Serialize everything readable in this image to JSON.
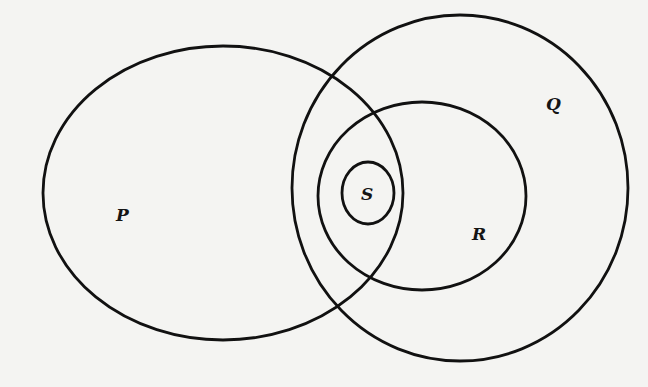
{
  "diagram": {
    "type": "venn",
    "colors": {
      "background": "#f4f4f2",
      "stroke": "#111111",
      "label": "#151515"
    },
    "sets": [
      {
        "id": "P",
        "label": "P",
        "cx": 223,
        "cy": 193,
        "rx": 180,
        "ry": 147,
        "label_x": 116,
        "label_y": 221
      },
      {
        "id": "Q",
        "label": "Q",
        "cx": 460,
        "cy": 188,
        "rx": 168,
        "ry": 173,
        "label_x": 546,
        "label_y": 110
      },
      {
        "id": "R",
        "label": "R",
        "cx": 422,
        "cy": 196,
        "rx": 104,
        "ry": 94,
        "label_x": 472,
        "label_y": 240
      },
      {
        "id": "S",
        "label": "S",
        "cx": 368,
        "cy": 193,
        "rx": 26,
        "ry": 31,
        "label_x": 361,
        "label_y": 200
      }
    ]
  }
}
